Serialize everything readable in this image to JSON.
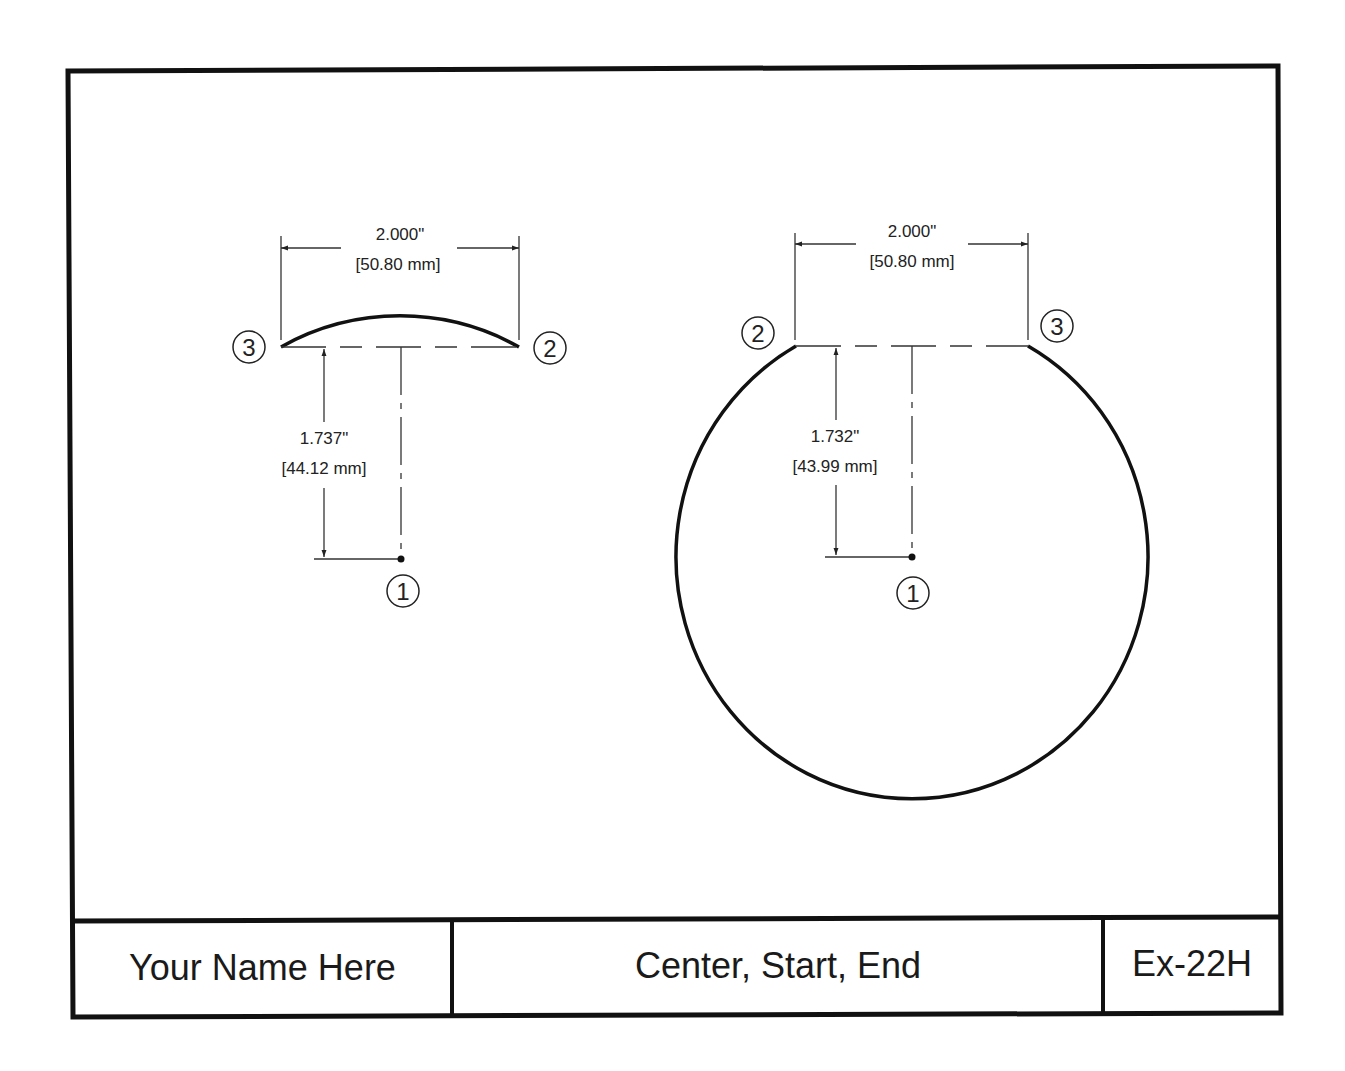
{
  "colors": {
    "ink": "#111111",
    "thin_ink": "#333333",
    "paper": "#ffffff"
  },
  "title_block": {
    "name": "Your Name Here",
    "title": "Center, Start, End",
    "number": "Ex-22H"
  },
  "left_figure": {
    "type": "arc",
    "width_dim": {
      "inch": "2.000\"",
      "mm": "[50.80 mm]"
    },
    "height_dim": {
      "inch": "1.737\"",
      "mm": "[44.12 mm]"
    },
    "markers": {
      "center": "1",
      "start": "2",
      "end": "3"
    }
  },
  "right_figure": {
    "type": "major-arc",
    "width_dim": {
      "inch": "2.000\"",
      "mm": "[50.80 mm]"
    },
    "height_dim": {
      "inch": "1.732\"",
      "mm": "[43.99 mm]"
    },
    "markers": {
      "center": "1",
      "start": "2",
      "end": "3"
    }
  }
}
